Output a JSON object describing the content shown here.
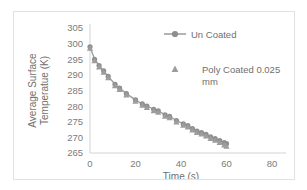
{
  "chart_data": {
    "type": "line",
    "title": "",
    "xlabel": "Time (s)",
    "ylabel_line1": "Average Surface",
    "ylabel_line2": "Temperatue (K)",
    "xlim": [
      0,
      80
    ],
    "ylim": [
      265,
      305
    ],
    "xticks": [
      0,
      20,
      40,
      60,
      80
    ],
    "yticks": [
      265,
      270,
      275,
      280,
      285,
      290,
      295,
      300,
      305
    ],
    "grid": false,
    "legend_position": "top-right-inside",
    "colors": {
      "series_line": "#9a9a9a",
      "marker_circle": "#8e8e8e",
      "marker_triangle": "#9d9d9d",
      "axis": "#d4d4d4",
      "text": "#7a7a7a",
      "frame": "#e2e2e2",
      "background": "#ffffff"
    },
    "series": [
      {
        "name": "Un Coated",
        "marker": "circle",
        "has_line": true,
        "x": [
          0,
          2,
          4,
          6,
          8,
          11,
          13,
          16,
          20,
          23,
          25,
          28,
          30,
          33,
          35,
          38,
          41,
          43,
          45,
          47,
          49,
          51,
          53,
          55,
          57,
          59,
          60
        ],
        "y": [
          299.0,
          295.0,
          293.0,
          291.3,
          289.5,
          287.0,
          285.8,
          284.0,
          282.0,
          280.7,
          280.0,
          279.0,
          278.5,
          277.2,
          276.7,
          275.4,
          274.3,
          273.8,
          272.8,
          272.0,
          271.5,
          271.0,
          270.2,
          269.6,
          269.0,
          268.3,
          268.0
        ]
      },
      {
        "name": "Poly Coated 0.025 mm",
        "marker": "triangle",
        "has_line": false,
        "x": [
          0,
          2,
          4,
          6,
          8,
          11,
          13,
          16,
          20,
          23,
          25,
          28,
          30,
          33,
          35,
          38,
          41,
          43,
          45,
          47,
          49,
          51,
          53,
          55,
          57,
          59,
          60
        ],
        "y": [
          298.6,
          294.6,
          292.6,
          290.9,
          289.1,
          286.6,
          285.4,
          283.6,
          281.6,
          280.3,
          279.6,
          278.6,
          278.1,
          276.8,
          276.3,
          275.0,
          273.9,
          273.4,
          272.4,
          271.6,
          271.1,
          270.5,
          269.7,
          269.1,
          268.4,
          267.6,
          267.2
        ]
      }
    ],
    "legend": [
      {
        "label": "Un Coated",
        "marker": "circle",
        "has_line": true
      },
      {
        "label": "Poly Coated 0.025",
        "label2": "mm",
        "marker": "triangle",
        "has_line": false
      }
    ]
  }
}
